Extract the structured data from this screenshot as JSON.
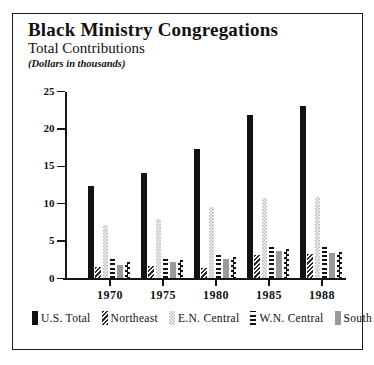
{
  "header": {
    "title": "Black Ministry Congregations",
    "subtitle": "Total Contributions",
    "note": "(Dollars in thousands)"
  },
  "chart_data": {
    "type": "bar",
    "title": "Black Ministry Congregations",
    "subtitle": "Total Contributions",
    "units_note": "(Dollars in thousands)",
    "categories": [
      "1970",
      "1975",
      "1980",
      "1985",
      "1988"
    ],
    "series": [
      {
        "name": "U.S. Total",
        "pattern": "solid-black",
        "values": [
          12.4,
          14.1,
          17.3,
          21.9,
          23.1
        ]
      },
      {
        "name": "Northeast",
        "pattern": "diagonal-hatch",
        "values": [
          1.5,
          1.7,
          1.4,
          3.2,
          3.3
        ]
      },
      {
        "name": "E.N. Central",
        "pattern": "light-checker",
        "values": [
          7.1,
          8.0,
          9.6,
          10.7,
          10.9
        ]
      },
      {
        "name": "W.N. Central",
        "pattern": "horizontal-stripes",
        "values": [
          2.6,
          2.9,
          3.2,
          4.5,
          4.4
        ]
      },
      {
        "name": "South",
        "pattern": "solid-gray",
        "values": [
          1.8,
          2.2,
          2.6,
          3.7,
          3.4
        ]
      },
      {
        "name": "West",
        "pattern": "checkerboard",
        "values": [
          2.2,
          2.5,
          2.9,
          3.9,
          3.6
        ]
      }
    ],
    "y_ticks": [
      0,
      5,
      10,
      15,
      20,
      25
    ],
    "ylim": [
      0,
      25
    ],
    "grid": false,
    "legend_position": "bottom",
    "colors": {
      "ink": "#161616",
      "gray_fill": "#9a9a9a",
      "light_fill": "#b9b9b9",
      "background": "#ffffff"
    }
  }
}
